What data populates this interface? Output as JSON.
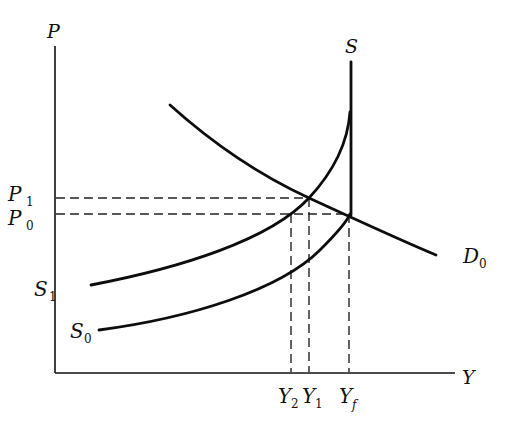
{
  "diagram": {
    "type": "supply-demand",
    "axes": {
      "y_label": "P",
      "x_label": "Y"
    },
    "price_levels": [
      {
        "main": "P",
        "sub": "1"
      },
      {
        "main": "P",
        "sub": "0"
      }
    ],
    "output_levels": [
      {
        "main": "Y",
        "sub": "2"
      },
      {
        "main": "Y",
        "sub": "1"
      },
      {
        "main": "Y",
        "sub": "f"
      }
    ],
    "curves": {
      "long_run_supply": {
        "label": "S"
      },
      "supply_1": {
        "main": "S",
        "sub": "1"
      },
      "supply_0": {
        "main": "S",
        "sub": "0"
      },
      "demand_0": {
        "main": "D",
        "sub": "0"
      }
    },
    "colors": {
      "ink": "#111111",
      "background": "#ffffff"
    }
  }
}
